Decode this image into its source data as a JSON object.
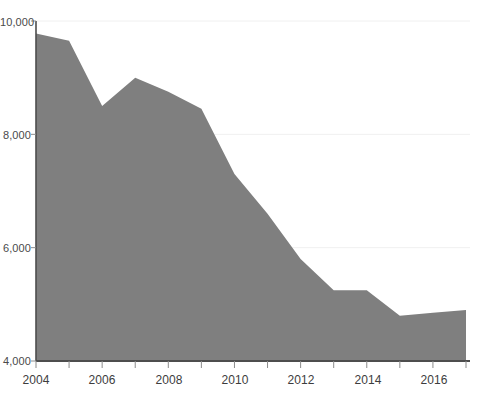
{
  "chart_data": {
    "type": "area",
    "title": "",
    "subtitle": "",
    "xlabel": "",
    "ylabel": "",
    "x": [
      2004,
      2005,
      2006,
      2007,
      2008,
      2009,
      2010,
      2011,
      2012,
      2013,
      2014,
      2015,
      2016,
      2017
    ],
    "values": [
      9780,
      9650,
      8500,
      9000,
      8750,
      8450,
      7300,
      6600,
      5800,
      5250,
      5250,
      4800,
      4850,
      4900
    ],
    "series": [
      {
        "name": "series-1",
        "values": [
          9780,
          9650,
          8500,
          9000,
          8750,
          8450,
          7300,
          6600,
          5800,
          5250,
          5250,
          4800,
          4850,
          4900
        ]
      }
    ],
    "xlim": [
      2004,
      2017
    ],
    "ylim": [
      4000,
      10000
    ],
    "y_ticks": [
      4000,
      6000,
      8000,
      10000
    ],
    "y_tick_labels": [
      "4,000",
      "6,000",
      "8,000",
      "10,000"
    ],
    "x_ticks": [
      2004,
      2005,
      2006,
      2007,
      2008,
      2009,
      2010,
      2011,
      2012,
      2013,
      2014,
      2015,
      2016,
      2017
    ],
    "x_tick_labels": [
      "2004",
      "",
      "2006",
      "",
      "2008",
      "",
      "2010",
      "",
      "2012",
      "",
      "2014",
      "",
      "2016",
      ""
    ],
    "x_tick_labels_visible": [
      "2004",
      "2006",
      "2008",
      "2010",
      "2012",
      "2014",
      "2016"
    ],
    "grid": true,
    "grid_axis": "y",
    "legend": false,
    "legend_position": "none",
    "colors": {
      "area_fill": "#7f7f7f",
      "gridline": "#f0f0f0",
      "axis_line": "#4d4d4d",
      "tick_mark": "#8c8c8c",
      "y_tick_text": "#4a4a4a",
      "x_tick_text": "#3d3d3d",
      "background": "#ffffff"
    },
    "annotations": []
  },
  "axes": {
    "y_labels": [
      "10,000",
      "8,000",
      "6,000",
      "4,000"
    ],
    "x_labels": [
      "2004",
      "2006",
      "2008",
      "2010",
      "2012",
      "2014",
      "2016"
    ]
  }
}
